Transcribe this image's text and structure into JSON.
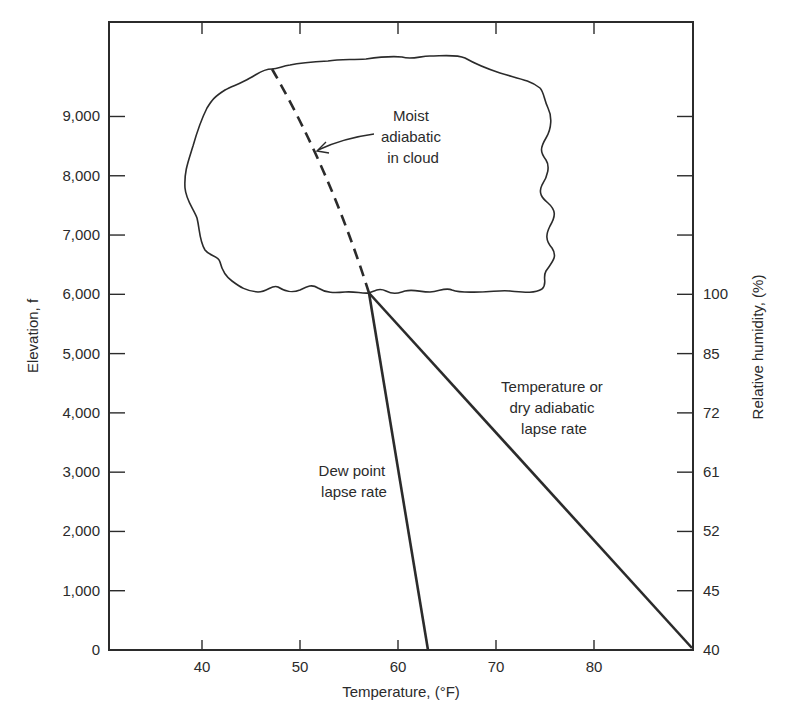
{
  "chart_data": {
    "type": "line",
    "title": "",
    "xlabel": "Temperature, (°F)",
    "ylabel": "Elevation, f",
    "y2label": "Relative humidity, (%)",
    "xlim": [
      30,
      90
    ],
    "ylim": [
      0,
      10500
    ],
    "x_ticks": [
      40,
      50,
      60,
      70,
      80
    ],
    "x_tick_labels": [
      "40",
      "50",
      "60",
      "70",
      "80"
    ],
    "y_ticks": [
      0,
      1000,
      2000,
      3000,
      4000,
      5000,
      6000,
      7000,
      8000,
      9000
    ],
    "y_tick_labels": [
      "0",
      "1,000",
      "2,000",
      "3,000",
      "4,000",
      "5,000",
      "6,000",
      "7,000",
      "8,000",
      "9,000"
    ],
    "y2_ticks": [
      0,
      1000,
      2000,
      3000,
      4000,
      5000,
      6000,
      7000,
      8000,
      9000
    ],
    "y2_tick_labels": [
      "40",
      "45",
      "52",
      "61",
      "72",
      "85",
      "100",
      "",
      "",
      ""
    ],
    "grid": false,
    "series": [
      {
        "name": "Temperature or dry adiabatic lapse rate",
        "style": "solid",
        "points": [
          [
            90,
            0
          ],
          [
            56.5,
            6000
          ]
        ]
      },
      {
        "name": "Dew point lapse rate",
        "style": "solid",
        "points": [
          [
            62.3,
            0
          ],
          [
            56.5,
            6000
          ]
        ]
      },
      {
        "name": "Moist adiabatic in cloud",
        "style": "dashed",
        "points": [
          [
            56.5,
            6000
          ],
          [
            54.5,
            7000
          ],
          [
            52.5,
            8000
          ],
          [
            50.3,
            9000
          ],
          [
            47.2,
            9800
          ]
        ]
      }
    ],
    "annotations": [
      {
        "text": [
          "Moist",
          "adiabatic",
          "in cloud"
        ],
        "arrow_to": [
          51,
          8300
        ]
      },
      {
        "text": [
          "Temperature or",
          "dry adiabatic",
          "lapse rate"
        ]
      },
      {
        "text": [
          "Dew point",
          "lapse rate"
        ]
      }
    ],
    "shapes": [
      {
        "name": "cloud",
        "base_elevation": 6000,
        "top_elevation": 10000,
        "x_range": [
          38,
          76
        ]
      }
    ]
  },
  "axes": {
    "x_title": "Temperature, (°F)",
    "y_title": "Elevation, f",
    "y2_title": "Relative humidity, (%)"
  },
  "labels": {
    "moist": [
      "Moist",
      "adiabatic",
      "in cloud"
    ],
    "dry": [
      "Temperature or",
      "dry adiabatic",
      "lapse rate"
    ],
    "dew": [
      "Dew point",
      "lapse rate"
    ]
  },
  "colors": {
    "ink": "#2b2b2b",
    "background": "#ffffff"
  }
}
